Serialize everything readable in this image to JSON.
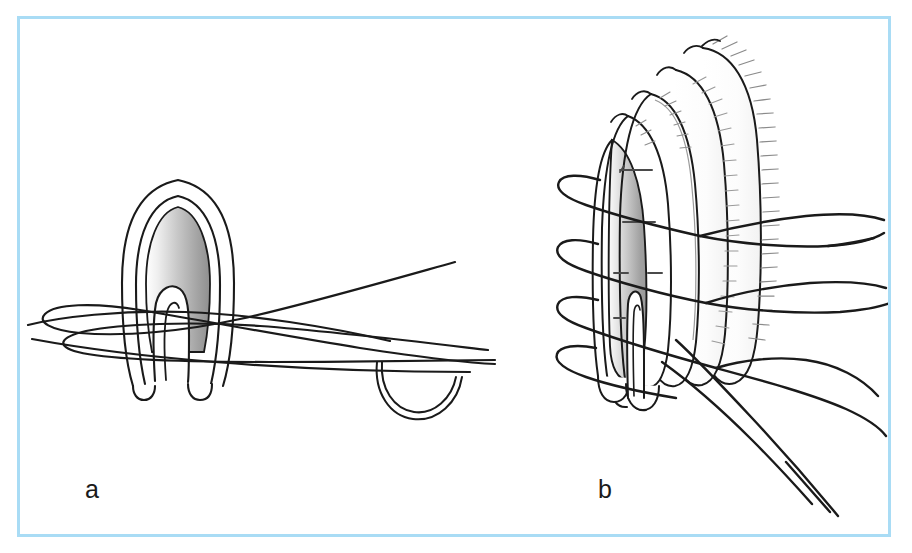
{
  "figure": {
    "type": "medical-surgical-illustration",
    "title": "",
    "caption": "",
    "background_color": "#ffffff",
    "frame": {
      "border_color": "#a9dcf5",
      "border_width_px": 3,
      "x": 17,
      "y": 16,
      "width": 874,
      "height": 521
    },
    "line_color": "#1a1a1a",
    "fill_gradient": {
      "light": "#f2f2f2",
      "mid": "#d0d0d0",
      "dark": "#9a9a9a"
    }
  },
  "panels": [
    {
      "id": "a",
      "label": "a",
      "label_x": 85,
      "label_y": 477,
      "view": "lateral-cross-section",
      "description": "Oval tissue structure in lateral cross-section with an inverted U-shaped inner fold and suture threads passing through, plus a curved surgical needle at lower right.",
      "elements": [
        {
          "name": "outer-tissue-outline",
          "shape": "oval-arch"
        },
        {
          "name": "inner-tissue-outline",
          "shape": "oval-arch"
        },
        {
          "name": "shaded-tissue-core",
          "shape": "oval-arch",
          "fill": "gradient-gray"
        },
        {
          "name": "inner-fold-loop",
          "shape": "inverted-u"
        },
        {
          "name": "suture-thread-loops",
          "count": 4
        },
        {
          "name": "curved-surgical-needle",
          "shape": "semicircle"
        }
      ]
    },
    {
      "id": "b",
      "label": "b",
      "label_x": 598,
      "label_y": 477,
      "view": "three-quarter-perspective",
      "description": "Layered tissue cuff seen in three-quarter perspective with concentric wall layers, hatched serosal margin and four horizontal suture loops whose free tails exit to the right and lower right.",
      "elements": [
        {
          "name": "outer-wall-layer",
          "shape": "arched-cuff"
        },
        {
          "name": "middle-wall-layer",
          "shape": "arched-cuff"
        },
        {
          "name": "inner-wall-layer",
          "shape": "arched-cuff"
        },
        {
          "name": "shaded-lumen-core",
          "shape": "arched-cuff",
          "fill": "gradient-gray"
        },
        {
          "name": "hatched-margin",
          "hatch_count": 34
        },
        {
          "name": "suture-loops",
          "count": 4
        },
        {
          "name": "suture-tails",
          "count": 6
        },
        {
          "name": "inner-fold-loop",
          "shape": "narrow-u"
        },
        {
          "name": "stitch-tick-marks",
          "count": 6
        }
      ]
    }
  ]
}
